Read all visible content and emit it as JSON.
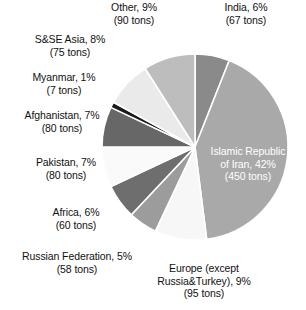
{
  "chart_data": {
    "type": "pie",
    "title": "",
    "subtitle": "",
    "xlabel": "",
    "ylabel": "",
    "legend_position": "none",
    "labels_position": "callout",
    "unit": "tons",
    "total_tons": 1062,
    "categories": [
      "India",
      "Islamic Republic of Iran",
      "Europe (except Russia&Turkey)",
      "Russian Federation",
      "Africa",
      "Pakistan",
      "Afghanistan",
      "Myanmar",
      "S&SE Asia",
      "Other"
    ],
    "values": [
      6,
      42,
      9,
      5,
      6,
      7,
      7,
      1,
      8,
      9
    ],
    "tons": [
      67,
      450,
      95,
      58,
      60,
      80,
      80,
      7,
      75,
      90
    ],
    "colors": [
      "#8a8a8a",
      "#a9a9a9",
      "#f7f7f7",
      "#9c9c9c",
      "#6e6e6e",
      "#fafafa",
      "#676767",
      "#1a1a1a",
      "#eaeaea",
      "#bdbdbd"
    ],
    "slices": [
      {
        "name": "India",
        "percent": 6,
        "tons": 67,
        "color": "#8a8a8a",
        "start_angle": 0,
        "end_angle": 21.6,
        "label_color": "#111111"
      },
      {
        "name": "Islamic Republic of Iran",
        "percent": 42,
        "tons": 450,
        "color": "#a9a9a9",
        "start_angle": 21.6,
        "end_angle": 172.8,
        "label_color": "#ffffff"
      },
      {
        "name": "Europe (except Russia&Turkey)",
        "percent": 9,
        "tons": 95,
        "color": "#f7f7f7",
        "start_angle": 172.8,
        "end_angle": 205.2,
        "label_color": "#111111"
      },
      {
        "name": "Russian Federation",
        "percent": 5,
        "tons": 58,
        "color": "#9c9c9c",
        "start_angle": 205.2,
        "end_angle": 223.2,
        "label_color": "#111111"
      },
      {
        "name": "Africa",
        "percent": 6,
        "tons": 60,
        "color": "#6e6e6e",
        "start_angle": 223.2,
        "end_angle": 244.8,
        "label_color": "#111111"
      },
      {
        "name": "Pakistan",
        "percent": 7,
        "tons": 80,
        "color": "#fafafa",
        "start_angle": 244.8,
        "end_angle": 270.0,
        "label_color": "#111111"
      },
      {
        "name": "Afghanistan",
        "percent": 7,
        "tons": 80,
        "color": "#676767",
        "start_angle": 270.0,
        "end_angle": 295.2,
        "label_color": "#111111"
      },
      {
        "name": "Myanmar",
        "percent": 1,
        "tons": 7,
        "color": "#1a1a1a",
        "start_angle": 295.2,
        "end_angle": 298.8,
        "label_color": "#111111"
      },
      {
        "name": "S&SE Asia",
        "percent": 8,
        "tons": 75,
        "color": "#eaeaea",
        "start_angle": 298.8,
        "end_angle": 327.6,
        "label_color": "#111111"
      },
      {
        "name": "Other",
        "percent": 9,
        "tons": 90,
        "color": "#bdbdbd",
        "start_angle": 327.6,
        "end_angle": 360.0,
        "label_color": "#111111"
      }
    ]
  },
  "callouts": {
    "other": "Other, 9%\n(90 tons)",
    "india": "India, 6%\n(67 tons)",
    "ssea": "S&SE Asia, 8%\n(75 tons)",
    "myanmar": "Myanmar, 1%\n(7 tons)",
    "afghanistan": "Afghanistan, 7%\n(80 tons)",
    "pakistan": "Pakistan, 7%\n(80 tons)",
    "africa": "Africa, 6%\n(60 tons)",
    "russia": "Russian Federation, 5%\n(58 tons)",
    "europe": "Europe (except\nRussia&Turkey), 9%\n(95 tons)",
    "iran": "Islamic Republic\nof Iran, 42%\n(450 tons)"
  },
  "style": {
    "background": "#ffffff",
    "slice_gap_color": "#ffffff",
    "text_color": "#111111",
    "inside_text_color": "#ffffff"
  },
  "geometry": {
    "center_x": 195,
    "center_y": 147,
    "radius": 93
  }
}
